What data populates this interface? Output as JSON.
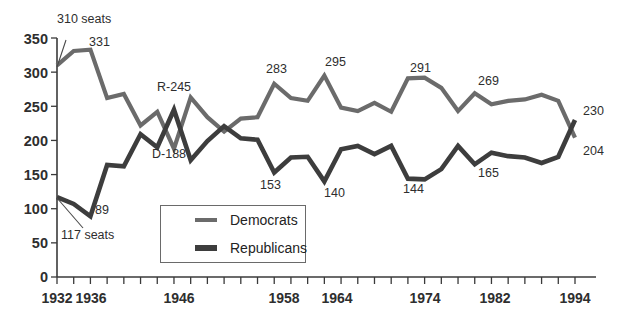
{
  "chart_data": {
    "type": "line",
    "title": "",
    "subtitle": "",
    "xlabel": "",
    "ylabel": "",
    "xlim": [
      1932,
      1994
    ],
    "ylim": [
      0,
      350
    ],
    "yticks": [
      0,
      50,
      100,
      150,
      200,
      250,
      300,
      350
    ],
    "xticks_labeled": [
      1932,
      1936,
      1946,
      1958,
      1964,
      1974,
      1982,
      1994
    ],
    "xtick_interval_years": 2,
    "grid": false,
    "legend_position": "inside-bottom-left",
    "x": [
      1932,
      1934,
      1936,
      1938,
      1940,
      1942,
      1944,
      1946,
      1948,
      1950,
      1952,
      1954,
      1956,
      1958,
      1960,
      1962,
      1964,
      1966,
      1968,
      1970,
      1972,
      1974,
      1976,
      1978,
      1980,
      1982,
      1984,
      1986,
      1988,
      1990,
      1992,
      1994
    ],
    "series": [
      {
        "name": "Democrats",
        "color": "#6b6b6b",
        "values": [
          310,
          331,
          333,
          262,
          268,
          222,
          242,
          188,
          263,
          234,
          213,
          232,
          234,
          283,
          262,
          258,
          295,
          248,
          243,
          255,
          242,
          291,
          292,
          277,
          243,
          269,
          253,
          258,
          260,
          267,
          258,
          204
        ]
      },
      {
        "name": "Republicans",
        "color": "#3d3d3d",
        "values": [
          117,
          107,
          89,
          164,
          162,
          209,
          190,
          245,
          171,
          199,
          221,
          203,
          201,
          153,
          175,
          176,
          140,
          187,
          192,
          180,
          192,
          144,
          143,
          158,
          192,
          165,
          182,
          177,
          175,
          167,
          176,
          230
        ]
      }
    ],
    "annotations": [
      {
        "text": "310 seats",
        "year": 1932,
        "value": 310,
        "series": "Democrats"
      },
      {
        "text": "331",
        "year": 1936,
        "value": 331,
        "series": "Democrats"
      },
      {
        "text": "R-245",
        "year": 1946,
        "value": 245,
        "series": "Republicans"
      },
      {
        "text": "D-188",
        "year": 1946,
        "value": 188,
        "series": "Democrats"
      },
      {
        "text": "283",
        "year": 1958,
        "value": 283,
        "series": "Democrats"
      },
      {
        "text": "295",
        "year": 1964,
        "value": 295,
        "series": "Democrats"
      },
      {
        "text": "291",
        "year": 1974,
        "value": 291,
        "series": "Democrats"
      },
      {
        "text": "269",
        "year": 1982,
        "value": 269,
        "series": "Democrats"
      },
      {
        "text": "230",
        "year": 1994,
        "value": 230,
        "series": "Republicans"
      },
      {
        "text": "117 seats",
        "year": 1932,
        "value": 117,
        "series": "Republicans"
      },
      {
        "text": "89",
        "year": 1936,
        "value": 89,
        "series": "Republicans"
      },
      {
        "text": "153",
        "year": 1958,
        "value": 153,
        "series": "Republicans"
      },
      {
        "text": "140",
        "year": 1964,
        "value": 140,
        "series": "Republicans"
      },
      {
        "text": "144",
        "year": 1974,
        "value": 144,
        "series": "Republicans"
      },
      {
        "text": "165",
        "year": 1982,
        "value": 165,
        "series": "Republicans"
      },
      {
        "text": "204",
        "year": 1994,
        "value": 204,
        "series": "Democrats"
      }
    ]
  },
  "yaxis": {
    "t0": "0",
    "t1": "50",
    "t2": "100",
    "t3": "150",
    "t4": "200",
    "t5": "250",
    "t6": "300",
    "t7": "350"
  },
  "xaxis": {
    "x1932": "1932",
    "x1936": "1936",
    "x1946": "1946",
    "x1958": "1958",
    "x1964": "1964",
    "x1974": "1974",
    "x1982": "1982",
    "x1994": "1994"
  },
  "annotations": {
    "a310": "310 seats",
    "a331": "331",
    "aR245": "R-245",
    "aD188": "D-188",
    "a283": "283",
    "a295": "295",
    "a291": "291",
    "a269": "269",
    "a230": "230",
    "a117": "117 seats",
    "a89": "89",
    "a153": "153",
    "a140": "140",
    "a144": "144",
    "a165": "165",
    "a204": "204"
  },
  "legend": {
    "democrats_label": "Democrats",
    "republicans_label": "Republicans"
  },
  "colors": {
    "democrats": "#6b6b6b",
    "republicans": "#3d3d3d",
    "axis": "#3a3a3a",
    "text": "#2e2e2e",
    "background": "#ffffff"
  }
}
